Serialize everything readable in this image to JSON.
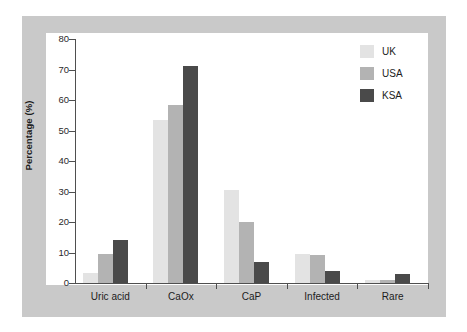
{
  "chart_data": {
    "type": "bar",
    "title": "",
    "xlabel": "",
    "ylabel": "Percentage (%)",
    "ylim": [
      0,
      80
    ],
    "yticks": [
      0,
      10,
      20,
      30,
      40,
      50,
      60,
      70,
      80
    ],
    "ytick_labels": [
      "0",
      "10",
      "20",
      "30",
      "40",
      "50",
      "60",
      "70",
      "80"
    ],
    "grid": false,
    "legend_position": "top-right",
    "categories": [
      "Uric acid",
      "CaOx",
      "CaP",
      "Infected",
      "Rare"
    ],
    "series": [
      {
        "name": "UK",
        "color": "#e3e3e3",
        "values": [
          3.3,
          53.5,
          30.5,
          9.5,
          1.0
        ]
      },
      {
        "name": "USA",
        "color": "#b3b3b3",
        "values": [
          9.6,
          58.5,
          20.0,
          9.1,
          1.0
        ]
      },
      {
        "name": "KSA",
        "color": "#4a4a4a",
        "values": [
          14.2,
          71.0,
          7.0,
          3.8,
          3.0
        ]
      }
    ]
  },
  "legend": {
    "items": [
      {
        "label": "UK",
        "color": "#e3e3e3"
      },
      {
        "label": "USA",
        "color": "#b3b3b3"
      },
      {
        "label": "KSA",
        "color": "#4a4a4a"
      }
    ]
  },
  "axis": {
    "y_title": "Percentage (%)"
  },
  "colors": {
    "frame": "#c9c9c9",
    "canvas": "#ffffff",
    "axis": "#4f4f4f",
    "text": "#1c1c1c",
    "uk": "#e3e3e3",
    "usa": "#b3b3b3",
    "ksa": "#4a4a4a"
  }
}
